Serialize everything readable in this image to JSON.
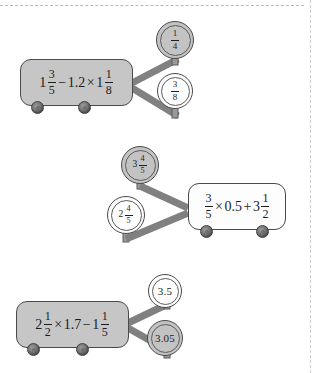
{
  "page": {
    "background_color": "#ffffff",
    "divider_color": "#b9b9b9",
    "ink_color": "#1d1d1d",
    "cart_gray": "#c6c6c6",
    "cart_white": "#fdfdfd",
    "connector_color": "#8c8c8c",
    "outline_color": "#4a4a4a"
  },
  "groups": [
    {
      "id": "group-1",
      "layout": "box-left-tokens-right",
      "cart": {
        "fill": "gray",
        "expression_text": "1 3/5 - 1.2 x 1 1/8",
        "parts": {
          "w1": "1",
          "f1_num": "3",
          "f1_den": "5",
          "op1": "−",
          "dec1": "1.2",
          "op2": "×",
          "w2": "1",
          "f2_num": "1",
          "f2_den": "8"
        }
      },
      "tokens": [
        {
          "fill": "gray",
          "value_text": "1/4",
          "parts": {
            "num": "1",
            "den": "4"
          }
        },
        {
          "fill": "white",
          "value_text": "3/8",
          "parts": {
            "num": "3",
            "den": "8"
          }
        }
      ]
    },
    {
      "id": "group-2",
      "layout": "tokens-left-box-right",
      "cart": {
        "fill": "white",
        "expression_text": "3/5 x 0.5 + 3 1/2",
        "parts": {
          "f1_num": "3",
          "f1_den": "5",
          "op1": "×",
          "dec1": "0.5",
          "op2": "+",
          "w2": "3",
          "f2_num": "1",
          "f2_den": "2"
        }
      },
      "tokens": [
        {
          "fill": "gray",
          "value_text": "3 4/5",
          "parts": {
            "whole": "3",
            "num": "4",
            "den": "5"
          }
        },
        {
          "fill": "white",
          "value_text": "2 4/5",
          "parts": {
            "whole": "2",
            "num": "4",
            "den": "5"
          }
        }
      ]
    },
    {
      "id": "group-3",
      "layout": "box-left-tokens-right",
      "cart": {
        "fill": "gray",
        "expression_text": "2 1/2 x 1.7 - 1 1/5",
        "parts": {
          "w1": "2",
          "f1_num": "1",
          "f1_den": "2",
          "op1": "×",
          "dec1": "1.7",
          "op2": "−",
          "w2": "1",
          "f2_num": "1",
          "f2_den": "5"
        }
      },
      "tokens": [
        {
          "fill": "white",
          "value_text": "3.5"
        },
        {
          "fill": "gray",
          "value_text": "3.05"
        }
      ]
    }
  ]
}
